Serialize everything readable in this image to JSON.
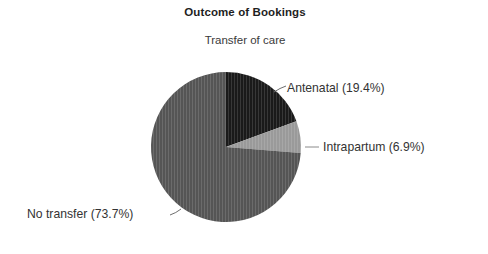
{
  "chart_data": {
    "type": "pie",
    "title": "Outcome of Bookings",
    "subtitle": "Transfer of care",
    "categories": [
      "Antenatal",
      "Intrapartum",
      "No transfer"
    ],
    "values": [
      19.4,
      6.9,
      73.7
    ],
    "value_unit": "%",
    "labels": [
      "Antenatal (19.4%)",
      "Intrapartum (6.9%)",
      "No transfer (73.7%)"
    ],
    "colors": [
      "#1a1a1a",
      "#9a9a9a",
      "#555555"
    ],
    "start_angle_deg": 0,
    "direction": "clockwise",
    "legend": "none",
    "labels_position": "outside-with-leader-lines",
    "background": "#ffffff"
  },
  "chart": {
    "title": "Outcome of Bookings",
    "subtitle": "Transfer of care",
    "slices": [
      {
        "name": "Antenatal",
        "label": "Antenatal (19.4%)",
        "value": 19.4,
        "color": "#1a1a1a"
      },
      {
        "name": "Intrapartum",
        "label": "Intrapartum (6.9%)",
        "value": 6.9,
        "color": "#9a9a9a"
      },
      {
        "name": "No transfer",
        "label": "No transfer (73.7%)",
        "value": 73.7,
        "color": "#555555"
      }
    ]
  }
}
